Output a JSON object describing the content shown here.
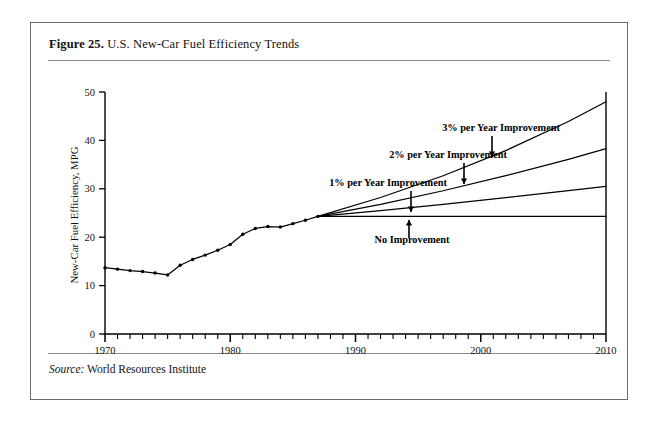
{
  "figure": {
    "label": "Figure 25.",
    "title": " U.S. New-Car Fuel Efficiency Trends",
    "source_keyword": "Source:",
    "source_text": " World Resources Institute"
  },
  "chart_data": {
    "type": "line",
    "title": "U.S. New-Car Fuel Efficiency Trends",
    "xlabel": "",
    "ylabel": "New-Car Fuel Efficiency, MPG",
    "xlim": [
      1970,
      2010
    ],
    "ylim": [
      0,
      50
    ],
    "yticks": [
      0,
      10,
      20,
      30,
      40,
      50
    ],
    "ytick_labels": [
      "0",
      "10",
      "20",
      "30",
      "40",
      "50"
    ],
    "xticks_major": [
      1970,
      1980,
      1990,
      2000,
      2010
    ],
    "xtick_labels": [
      "1970",
      "1980",
      "1990",
      "2000",
      "2010"
    ],
    "xtick_minor_step": 1,
    "grid": false,
    "legend": "none",
    "branch_year": 1987,
    "branch_value": 24.3,
    "series": [
      {
        "name": "Historical new-car fuel efficiency",
        "style": "solid-with-markers",
        "x": [
          1970,
          1971,
          1972,
          1973,
          1974,
          1975,
          1976,
          1977,
          1978,
          1979,
          1980,
          1981,
          1982,
          1983,
          1984,
          1985,
          1986,
          1987
        ],
        "values": [
          13.7,
          13.4,
          13.1,
          12.9,
          12.6,
          12.2,
          14.2,
          15.4,
          16.3,
          17.3,
          18.5,
          20.6,
          21.8,
          22.2,
          22.1,
          22.8,
          23.5,
          24.3
        ]
      },
      {
        "name": "No Improvement",
        "style": "solid",
        "x": [
          1987,
          2010
        ],
        "values": [
          24.3,
          24.3
        ]
      },
      {
        "name": "1% per Year Improvement",
        "style": "solid",
        "x": [
          1987,
          1992,
          1997,
          2002,
          2007,
          2010
        ],
        "values": [
          24.3,
          25.5,
          26.8,
          28.2,
          29.6,
          30.5
        ]
      },
      {
        "name": "2% per Year Improvement",
        "style": "solid",
        "x": [
          1987,
          1992,
          1997,
          2002,
          2007,
          2010
        ],
        "values": [
          24.3,
          26.8,
          29.6,
          32.7,
          36.1,
          38.3
        ]
      },
      {
        "name": "3% per Year Improvement",
        "style": "solid",
        "x": [
          1987,
          1992,
          1997,
          2002,
          2007,
          2010
        ],
        "values": [
          24.3,
          28.2,
          32.7,
          37.9,
          43.9,
          48.0
        ]
      }
    ],
    "annotations": [
      {
        "text": "3% per Year Improvement",
        "arrow": "down",
        "text_x": 501,
        "text_y": 131,
        "arrow_x": 492,
        "arrow_y0": 136,
        "arrow_y1": 157
      },
      {
        "text": "2% per Year Improvement",
        "arrow": "down",
        "text_x": 448,
        "text_y": 158,
        "arrow_x": 464,
        "arrow_y0": 163,
        "arrow_y1": 184
      },
      {
        "text": "1% per Year Improvement",
        "arrow": "down",
        "text_x": 388,
        "text_y": 186,
        "arrow_x": 411,
        "arrow_y0": 191,
        "arrow_y1": 212
      },
      {
        "text": "No Improvement",
        "arrow": "up",
        "text_x": 412,
        "text_y": 243,
        "arrow_x": 409,
        "arrow_y0": 238,
        "arrow_y1": 220
      }
    ]
  }
}
